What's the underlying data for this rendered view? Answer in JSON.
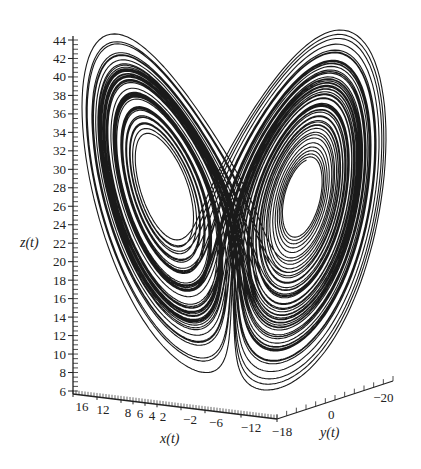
{
  "chart_data": {
    "type": "line",
    "subtype": "3d-parametric-curve",
    "title": "",
    "xlabel": "x(t)",
    "ylabel": "y(t)",
    "zlabel": "z(t)",
    "x_ticks": [
      "16",
      "12",
      "8",
      "6",
      "4",
      "2",
      "-2",
      "-6",
      "-12",
      "-18"
    ],
    "y_ticks": [
      "0",
      "-20"
    ],
    "z_ticks": [
      "44",
      "42",
      "40",
      "38",
      "36",
      "34",
      "32",
      "30",
      "28",
      "26",
      "24",
      "22",
      "20",
      "18",
      "16",
      "14",
      "12",
      "10",
      "8",
      "6"
    ],
    "xlim": [
      16,
      -18
    ],
    "ylim": [
      -18,
      -20
    ],
    "zlim": [
      6,
      44
    ],
    "line_color": "#1a1a1a",
    "grid": false,
    "legend": null
  },
  "colors": {
    "background": "#ffffff",
    "curve": "#1a1a1a",
    "axis": "#222222"
  }
}
